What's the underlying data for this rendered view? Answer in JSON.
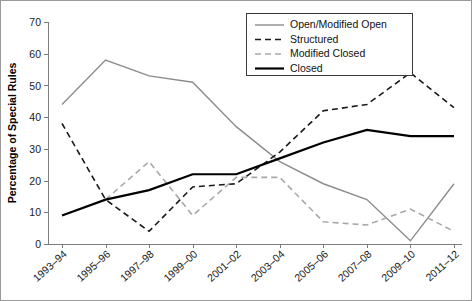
{
  "chart_data": {
    "type": "line",
    "title": "",
    "xlabel": "",
    "ylabel": "Percentage of Special Rules",
    "ylim": [
      0,
      70
    ],
    "yticks": [
      0,
      10,
      20,
      30,
      40,
      50,
      60,
      70
    ],
    "grid": false,
    "legend_position": "top-right",
    "categories": [
      "1993–94",
      "1995–96",
      "1997–98",
      "1999–00",
      "2001–02",
      "2003–04",
      "2005–06",
      "2007–08",
      "2009–10",
      "2011–12"
    ],
    "series": [
      {
        "name": "Open/Modified Open",
        "color": "#8c8c8c",
        "style": "solid",
        "width": 1.4,
        "values": [
          44,
          58,
          53,
          51,
          37,
          26,
          19,
          14,
          1,
          19
        ]
      },
      {
        "name": "Structured",
        "color": "#1a1a1a",
        "style": "dashed",
        "width": 1.6,
        "values": [
          38,
          14,
          4,
          18,
          19,
          29,
          42,
          44,
          54,
          43
        ]
      },
      {
        "name": "Modified Closed",
        "color": "#a8a8a8",
        "style": "dashed",
        "width": 1.6,
        "values": [
          null,
          14,
          26,
          9,
          21,
          21,
          7,
          6,
          11,
          4
        ]
      },
      {
        "name": "Closed",
        "color": "#000000",
        "style": "solid",
        "width": 2.2,
        "values": [
          9,
          14,
          17,
          22,
          22,
          27,
          32,
          36,
          34,
          34
        ]
      }
    ]
  },
  "axes": {
    "y_axis_title": "Percentage of Special Rules",
    "y_tick_labels": [
      "0",
      "10",
      "20",
      "30",
      "40",
      "50",
      "60",
      "70"
    ],
    "x_tick_labels": [
      "1993–94",
      "1995–96",
      "1997–98",
      "1999–00",
      "2001–02",
      "2003–04",
      "2005–06",
      "2007–08",
      "2009–10",
      "2011–12"
    ]
  },
  "legend": {
    "entries": [
      {
        "label": "Open/Modified Open"
      },
      {
        "label": "Structured"
      },
      {
        "label": "Modified Closed"
      },
      {
        "label": "Closed"
      }
    ]
  }
}
